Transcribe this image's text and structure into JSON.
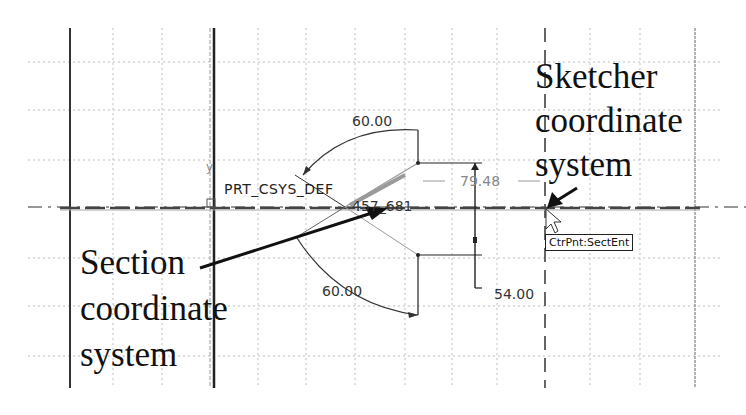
{
  "annotations": {
    "sketcher_label": [
      "Sketcher",
      "coordinate",
      "system"
    ],
    "section_label": [
      "Section",
      "coordinate",
      "system"
    ]
  },
  "cad": {
    "csys_name": "PRT_CSYS_DEF",
    "entity_id": "457_681",
    "axis_y_label": "y",
    "tooltip": "CtrPnt:SectEnt",
    "dimensions": {
      "angle_top": "60.00",
      "angle_bottom": "60.00",
      "horizontal": "79.48",
      "vertical": "54.00"
    }
  },
  "colors": {
    "grid": "#b8b8b8",
    "geometry": "#222222",
    "construction": "#888888",
    "background": "#ffffff"
  }
}
